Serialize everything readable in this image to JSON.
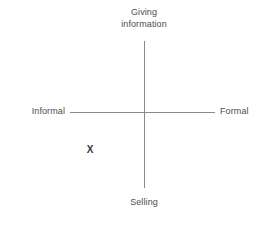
{
  "diagram": {
    "type": "two-axis-quadrant",
    "background_color": "#ffffff",
    "axis_color": "#8a8a8a",
    "label_color": "#4d4d4d",
    "marker_color": "#3a3a3a",
    "axes": {
      "vertical": {
        "top_label": "Giving\ninformation",
        "top_label_line1": "Giving",
        "top_label_line2": "information",
        "bottom_label": "Selling"
      },
      "horizontal": {
        "left_label": "Informal",
        "right_label": "Formal"
      }
    },
    "markers": [
      {
        "glyph": "X",
        "quadrant": "lower-left",
        "x_pct": 33,
        "y_pct": 66
      }
    ]
  }
}
